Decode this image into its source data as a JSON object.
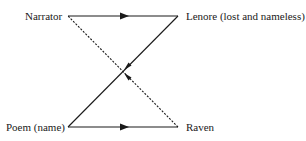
{
  "diagram": {
    "nodes": [
      {
        "id": "narrator",
        "label": "Narrator"
      },
      {
        "id": "lenore",
        "label": "Lenore (lost and nameless)"
      },
      {
        "id": "poem",
        "label": "Poem (name)"
      },
      {
        "id": "raven",
        "label": "Raven"
      }
    ],
    "edges": [
      {
        "from": "narrator",
        "to": "lenore",
        "style": "solid",
        "arrow": "mid"
      },
      {
        "from": "lenore",
        "to": "poem",
        "style": "solid",
        "arrow": "near-center"
      },
      {
        "from": "poem",
        "to": "raven",
        "style": "solid",
        "arrow": "mid"
      },
      {
        "from": "raven",
        "to": "narrator",
        "style": "dashed",
        "arrow": "near-center"
      }
    ],
    "colors": {
      "line": "#1a1a1a",
      "background": "#ffffff"
    }
  }
}
